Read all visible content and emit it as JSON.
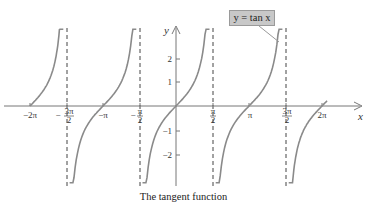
{
  "chart_data": {
    "type": "line",
    "title": "The tangent function",
    "function": "y = tan x",
    "xlabel": "x",
    "ylabel": "y",
    "xlim": [
      -6.6,
      7.0
    ],
    "ylim": [
      -3.2,
      3.2
    ],
    "grid": false,
    "x_ticks": [
      {
        "value": -6.2832,
        "label": "−2π"
      },
      {
        "value": -4.7124,
        "label": "−3π/2"
      },
      {
        "value": -3.1416,
        "label": "−π"
      },
      {
        "value": -1.5708,
        "label": "−π/2"
      },
      {
        "value": 1.5708,
        "label": "π/2"
      },
      {
        "value": 3.1416,
        "label": "π"
      },
      {
        "value": 4.7124,
        "label": "3π/2"
      },
      {
        "value": 6.2832,
        "label": "2π"
      }
    ],
    "y_ticks": [
      {
        "value": 2,
        "label": "2"
      },
      {
        "value": 1,
        "label": "1"
      },
      {
        "value": -1,
        "label": "−1"
      },
      {
        "value": -2,
        "label": "−2"
      }
    ],
    "asymptotes": [
      -4.7124,
      -1.5708,
      1.5708,
      4.7124
    ],
    "asymptote_style": "dashed",
    "branches": [
      {
        "x_from": -6.2832,
        "x_to": -4.85,
        "zero_at": -6.2832
      },
      {
        "x_from": -4.58,
        "x_to": -1.71,
        "zero_at": -3.1416
      },
      {
        "x_from": -1.44,
        "x_to": 1.44,
        "zero_at": 0
      },
      {
        "x_from": 1.71,
        "x_to": 4.58,
        "zero_at": 3.1416
      },
      {
        "x_from": 4.85,
        "x_to": 6.5,
        "zero_at": 6.2832
      }
    ],
    "legend": [
      {
        "label": "y = tan x",
        "position": "top-right callout"
      }
    ],
    "colors": {
      "curve": "#8a8a8a",
      "axis": "#777777",
      "asymptote": "#444444",
      "legend_bg": "#c8c8c8"
    }
  },
  "labels": {
    "legend": "y = tan x",
    "caption": "The tangent function",
    "x_axis": "x",
    "y_axis": "y",
    "x_ticks": {
      "m2pi": "−2π",
      "m3pi2_num": "3π",
      "m3pi2_den": "2",
      "mpi": "−π",
      "mpi2_num": "π",
      "mpi2_den": "2",
      "pi2_num": "π",
      "pi2_den": "2",
      "pi": "π",
      "p3pi2_num": "3π",
      "p3pi2_den": "2",
      "p2pi": "2π"
    },
    "y_ticks": {
      "p2": "2",
      "p1": "1",
      "m1": "−1",
      "m2": "−2"
    },
    "minus": "−"
  }
}
